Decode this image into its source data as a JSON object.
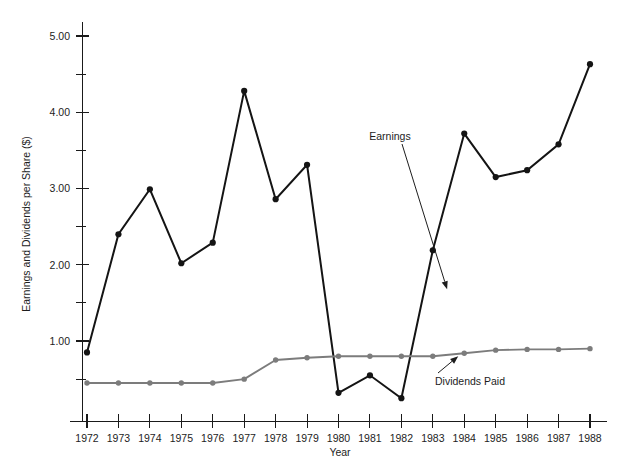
{
  "chart_data": {
    "type": "line",
    "title": "",
    "xlabel": "Year",
    "ylabel": "Earnings and Dividends per Share ($)",
    "categories": [
      1972,
      1973,
      1974,
      1975,
      1976,
      1977,
      1978,
      1979,
      1980,
      1981,
      1982,
      1983,
      1984,
      1985,
      1986,
      1987,
      1988
    ],
    "x_tick_labels": [
      "1972",
      "1973",
      "1974",
      "1975",
      "1976",
      "1977",
      "1978",
      "1979",
      "1980",
      "1981",
      "1982",
      "1983",
      "1984",
      "1985",
      "1986",
      "1987",
      "1988"
    ],
    "y_tick_labels": [
      "1.00",
      "2.00",
      "3.00",
      "4.00",
      "5.00"
    ],
    "y_major_ticks": [
      1.0,
      2.0,
      3.0,
      4.0,
      5.0
    ],
    "y_minor_ticks": [
      0.5,
      1.5,
      2.5,
      3.5,
      4.5
    ],
    "ylim": [
      0.0,
      5.35
    ],
    "xlim": [
      1971.6,
      1988.6
    ],
    "grid": false,
    "legend_position": "inline-annotations",
    "series": [
      {
        "name": "Earnings",
        "color": "#141414",
        "marker": "filled-circle",
        "values": [
          0.85,
          2.4,
          2.99,
          2.02,
          2.29,
          4.28,
          2.86,
          3.31,
          0.32,
          0.55,
          0.25,
          2.19,
          3.72,
          3.15,
          3.24,
          3.58,
          4.63
        ]
      },
      {
        "name": "Dividends Paid",
        "color": "#7c7c7c",
        "marker": "filled-circle",
        "values": [
          0.45,
          0.45,
          0.45,
          0.45,
          0.45,
          0.5,
          0.75,
          0.78,
          0.8,
          0.8,
          0.8,
          0.8,
          0.84,
          0.88,
          0.89,
          0.89,
          0.9
        ]
      }
    ],
    "annotations": [
      {
        "text": "Earnings",
        "target_series": "Earnings",
        "label_x": 390,
        "label_y": 140
      },
      {
        "text": "Dividends Paid",
        "target_series": "Dividends Paid",
        "label_x": 470,
        "label_y": 385
      }
    ]
  }
}
